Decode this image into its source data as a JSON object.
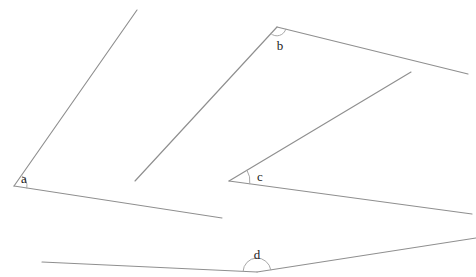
{
  "canvas": {
    "width": 476,
    "height": 277,
    "background_color": "#ffffff",
    "line_color": "#8f8f8f",
    "arc_color": "#a8a8a8",
    "label_color": "#1a1a1a"
  },
  "angles": [
    {
      "id": "a",
      "label": "a",
      "vertex": {
        "x": 14,
        "y": 186
      },
      "label_pos": {
        "x": 24,
        "y": 180
      },
      "arc_radius": 13,
      "rays": [
        {
          "name": "ray-a-upper",
          "x2": 137,
          "y2": 10
        },
        {
          "name": "ray-a-lower",
          "x2": 222,
          "y2": 218
        }
      ]
    },
    {
      "id": "b",
      "label": "b",
      "vertex": {
        "x": 277,
        "y": 27
      },
      "label_pos": {
        "x": 280,
        "y": 47
      },
      "arc_radius": 9,
      "rays": [
        {
          "name": "ray-b-left",
          "x2": 135,
          "y2": 181
        },
        {
          "name": "ray-b-right",
          "x2": 468,
          "y2": 74
        }
      ]
    },
    {
      "id": "c",
      "label": "c",
      "vertex": {
        "x": 229,
        "y": 181
      },
      "label_pos": {
        "x": 260,
        "y": 178
      },
      "arc_radius": 21,
      "rays": [
        {
          "name": "ray-c-upper",
          "x2": 411,
          "y2": 72
        },
        {
          "name": "ray-c-lower",
          "x2": 472,
          "y2": 214
        }
      ]
    },
    {
      "id": "d",
      "label": "d",
      "vertex": {
        "x": 257,
        "y": 272
      },
      "label_pos": {
        "x": 257,
        "y": 256
      },
      "arc_radius": 14,
      "rays": [
        {
          "name": "ray-d-left",
          "x2": 42,
          "y2": 262
        },
        {
          "name": "ray-d-right",
          "x2": 476,
          "y2": 238
        }
      ]
    }
  ]
}
